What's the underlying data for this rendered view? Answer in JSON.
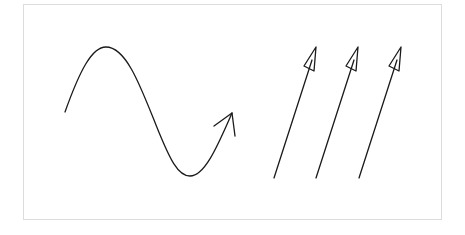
{
  "diagram": {
    "stroke_color": "#1a1a1a",
    "frame_color": "#dcdcdc",
    "wave": {
      "type": "sine",
      "start": [
        65,
        112
      ],
      "peak": [
        106,
        47
      ],
      "trough": [
        190,
        176
      ],
      "end": [
        232,
        113
      ],
      "arrowhead": "open-v"
    },
    "rays": [
      {
        "from": [
          274,
          178
        ],
        "to": [
          316,
          47
        ],
        "arrowhead": "open-triangle"
      },
      {
        "from": [
          316,
          178
        ],
        "to": [
          358,
          47
        ],
        "arrowhead": "open-triangle"
      },
      {
        "from": [
          359,
          178
        ],
        "to": [
          401,
          47
        ],
        "arrowhead": "open-triangle"
      }
    ]
  }
}
